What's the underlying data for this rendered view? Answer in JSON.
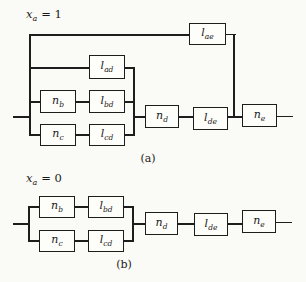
{
  "colors": {
    "background": "#fafaf6",
    "line": "#1d1d1d",
    "box_fill": "#fdfdfa",
    "text": "#1a1a1a"
  },
  "diagram_a": {
    "case": {
      "var": "x",
      "sub": "a",
      "rhs": "= 1"
    },
    "caption": "(a)",
    "blocks": {
      "lae": {
        "main": "l",
        "sub": "ae"
      },
      "lad": {
        "main": "l",
        "sub": "ad"
      },
      "nb": {
        "main": "n",
        "sub": "b"
      },
      "lbd": {
        "main": "l",
        "sub": "bd"
      },
      "nc": {
        "main": "n",
        "sub": "c"
      },
      "lcd": {
        "main": "l",
        "sub": "cd"
      },
      "nd": {
        "main": "n",
        "sub": "d"
      },
      "lde": {
        "main": "l",
        "sub": "de"
      },
      "ne": {
        "main": "n",
        "sub": "e"
      }
    }
  },
  "diagram_b": {
    "case": {
      "var": "x",
      "sub": "a",
      "rhs": "= 0"
    },
    "caption": "(b)",
    "blocks": {
      "nb": {
        "main": "n",
        "sub": "b"
      },
      "lbd": {
        "main": "l",
        "sub": "bd"
      },
      "nc": {
        "main": "n",
        "sub": "c"
      },
      "lcd": {
        "main": "l",
        "sub": "cd"
      },
      "nd": {
        "main": "n",
        "sub": "d"
      },
      "lde": {
        "main": "l",
        "sub": "de"
      },
      "ne": {
        "main": "n",
        "sub": "e"
      }
    }
  }
}
